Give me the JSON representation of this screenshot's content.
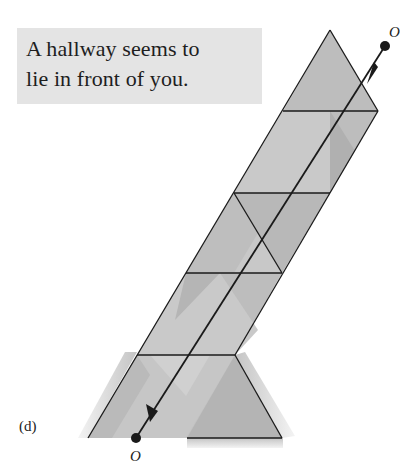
{
  "caption": {
    "line1": "A hallway seems to",
    "line2": "lie in front of you."
  },
  "figure_label": "(d)",
  "points": {
    "start": "O",
    "end": "O"
  },
  "colors": {
    "caption_bg": "#e4e4e4",
    "panel_mid": "#bdbdbd",
    "panel_light": "#cfcfcf",
    "panel_dark": "#ababab",
    "line": "#1a1a1a"
  }
}
